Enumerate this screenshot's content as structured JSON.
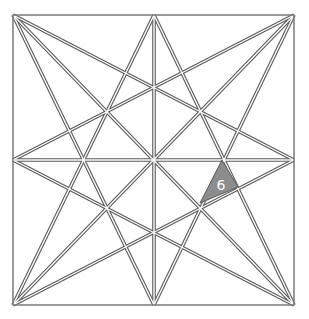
{
  "diagram": {
    "type": "star-lattice-in-square",
    "colors": {
      "line_outline": "#5a5a5a",
      "line_core": "#ffffff",
      "border": "#7a7a7a",
      "shaded_fill": "#8c8c8c",
      "label_color": "#ffffff"
    },
    "points": {
      "TL": [
        13,
        15
      ],
      "TM": [
        154,
        15
      ],
      "TR": [
        294,
        15
      ],
      "LM": [
        13,
        160
      ],
      "C": [
        154,
        160
      ],
      "RM": [
        294,
        160
      ],
      "BL": [
        13,
        305
      ],
      "BM": [
        154,
        305
      ],
      "BR": [
        294,
        305
      ]
    },
    "lines": [
      [
        "TL",
        "RM"
      ],
      [
        "TL",
        "BM"
      ],
      [
        "TL",
        "BR"
      ],
      [
        "TR",
        "LM"
      ],
      [
        "TR",
        "BM"
      ],
      [
        "TR",
        "BL"
      ],
      [
        "BL",
        "TM"
      ],
      [
        "BL",
        "RM"
      ],
      [
        "BR",
        "TM"
      ],
      [
        "BR",
        "LM"
      ],
      [
        "TM",
        "BM"
      ],
      [
        "LM",
        "RM"
      ]
    ],
    "shaded_region": {
      "label": "6",
      "polygon": [
        [
          222,
          160
        ],
        [
          200,
          203
        ],
        [
          238,
          187
        ]
      ],
      "label_pos": [
        221,
        190
      ]
    }
  }
}
